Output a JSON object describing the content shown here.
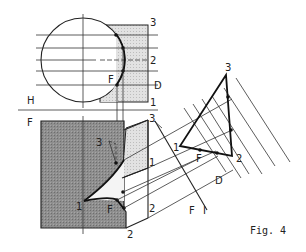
{
  "figure": {
    "caption": "Fig. 4",
    "type": "descriptive-geometry construction: cylinder cut by an oblique plane, with auxiliary true-size view",
    "colors": {
      "line": "#222222",
      "dark_fill": "#8a8a8a",
      "light_fill": "#d9d9d9",
      "background": "#ffffff"
    }
  },
  "labels": {
    "top_view": {
      "plane_label": "H",
      "point_3": "3",
      "point_2": "2",
      "point_F": "F",
      "point_D": "D",
      "point_1": "1"
    },
    "front_view": {
      "plane_label": "F",
      "point_3_right": "3",
      "point_3_inner": "3",
      "point_1_right": "1",
      "point_1_left": "1",
      "point_F": "F",
      "point_2_right": "2",
      "point_2_bottom": "2"
    },
    "aux_view": {
      "point_3": "3",
      "point_1": "1",
      "point_F": "F",
      "point_2": "2",
      "point_D": "D",
      "axis_label_F": "F",
      "axis_label_I": "I"
    }
  }
}
